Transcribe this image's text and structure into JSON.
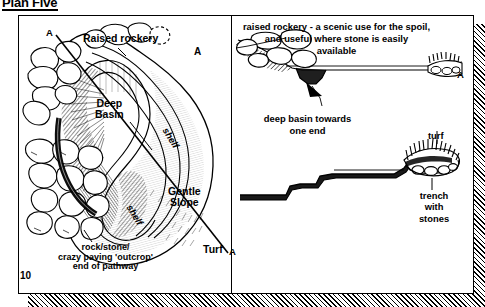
{
  "page": {
    "title": "Plan Five",
    "folio": "10"
  },
  "plan": {
    "labels": {
      "section_mark_top": "A",
      "section_mark_bottom": "A",
      "raised_rockery": "Raised rockery",
      "deep_basin": "Deep\nBasin",
      "gentle_slope": "Gentle\nSlope",
      "turf": "Turf",
      "shelf_upper": "shelf",
      "shelf_lower": "shelf",
      "rock_outcrop": "rock/stone/\ncrazy paving 'outcrop'\nend of pathway"
    }
  },
  "sections": {
    "upper": {
      "mark_left": "A",
      "mark_right": "A",
      "caption": "raised rockery - a scenic use for the spoil,\nand useful where stone is easily\navailable",
      "note": "deep basin towards\none end"
    },
    "lower": {
      "turf": "turf",
      "trench": "trench\nwith\nstones"
    }
  },
  "colors": {
    "ink": "#000000",
    "paper": "#ffffff"
  }
}
